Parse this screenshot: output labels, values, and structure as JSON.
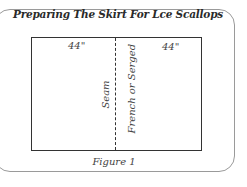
{
  "figure": {
    "title": "Preparing The Skirt For Lce Scallops",
    "caption": "Figure 1",
    "measurements": {
      "left": "44\"",
      "right": "44\""
    },
    "labels": {
      "seam": "Seam",
      "seam_type": "French or Serged"
    },
    "colors": {
      "line": "#333333",
      "frame": "#9a9a9a",
      "text": "#444444"
    }
  }
}
